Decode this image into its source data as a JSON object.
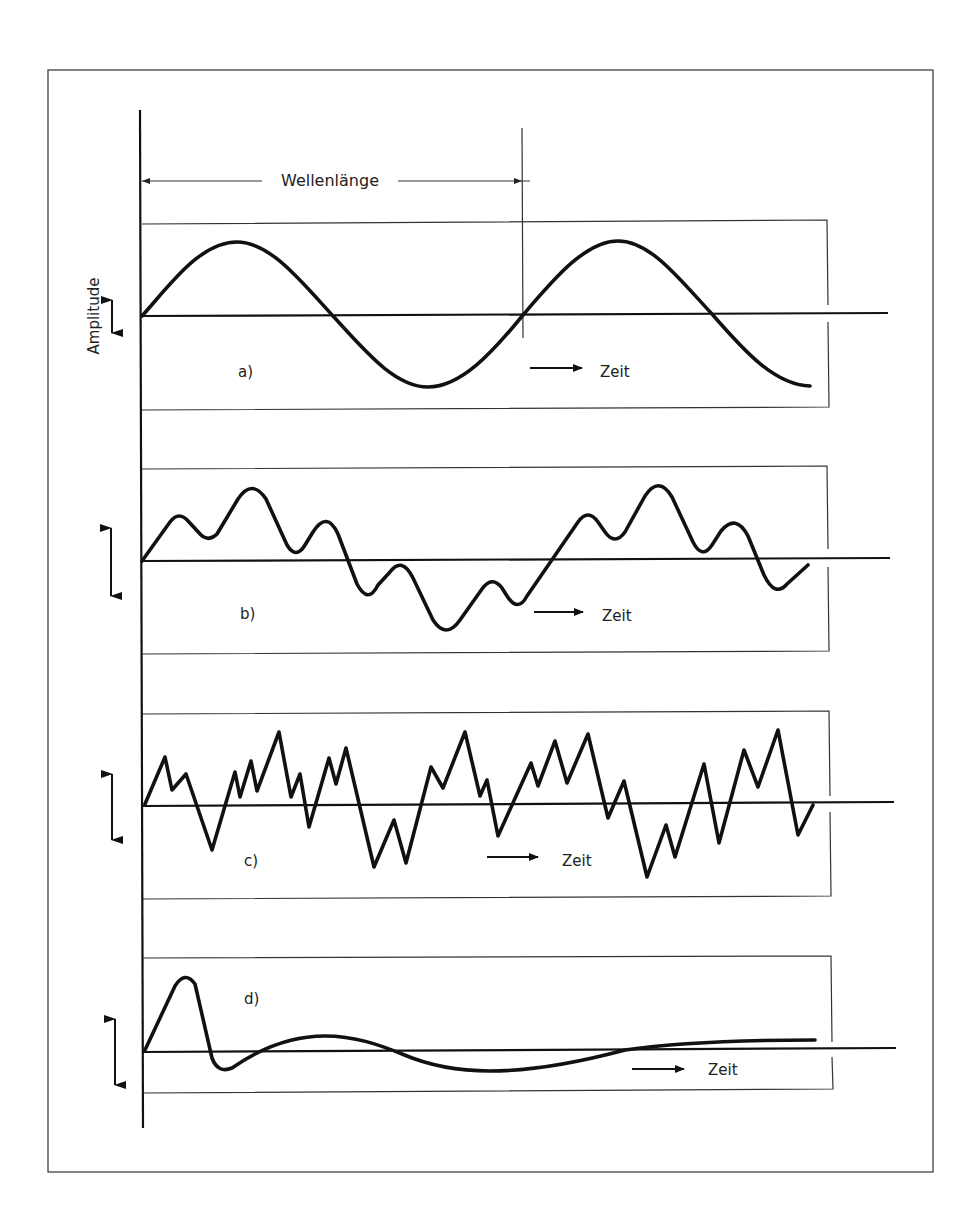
{
  "figure": {
    "wavelength_label": "Wellenlänge",
    "amplitude_label": "Amplitude",
    "time_label": "Zeit",
    "panels": [
      {
        "id": "a",
        "label": "a)",
        "description": "pure sine wave, ~1.75 periods"
      },
      {
        "id": "b",
        "label": "b)",
        "description": "superposition of sine waves (complex periodic wave)"
      },
      {
        "id": "c",
        "label": "c)",
        "description": "irregular noise-like zigzag wave"
      },
      {
        "id": "d",
        "label": "d)",
        "description": "damped transient oscillation"
      }
    ]
  },
  "colors": {
    "background": "#ffffff",
    "line": "#111111",
    "frame": "#333333"
  }
}
